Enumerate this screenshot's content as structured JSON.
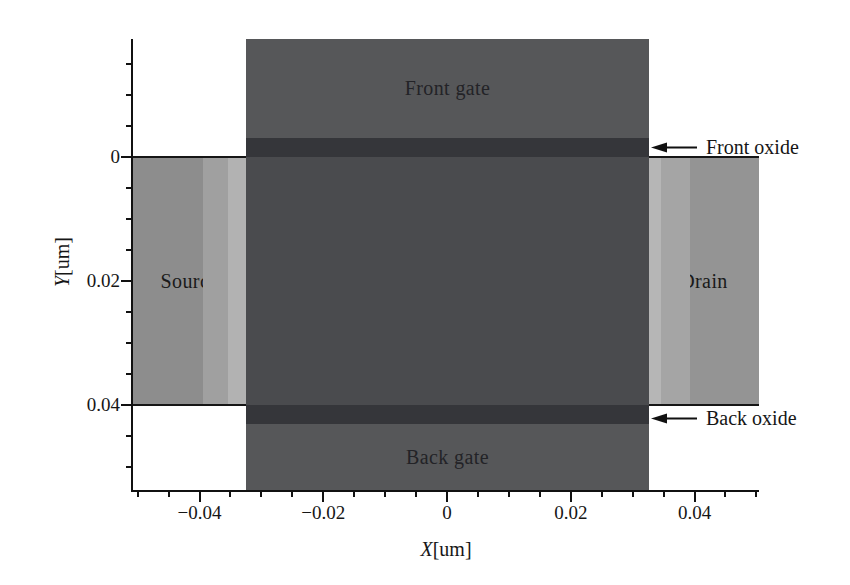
{
  "chart_data": {
    "type": "area",
    "title": "",
    "xlabel": "X[um]",
    "ylabel": "Y[um]",
    "x_axis": {
      "title_var": "X",
      "title_unit": "[um]",
      "range_um": [
        -0.0505,
        0.0505
      ],
      "major_ticks": [
        {
          "value": -0.04,
          "label": "−0.04"
        },
        {
          "value": -0.02,
          "label": "−0.02"
        },
        {
          "value": 0,
          "label": "0"
        },
        {
          "value": 0.02,
          "label": "0.02"
        },
        {
          "value": 0.04,
          "label": "0.04"
        }
      ],
      "minor_step_um": 0.005,
      "minor_range_um": [
        -0.05,
        0.05
      ]
    },
    "y_axis": {
      "title_var": "Y",
      "title_unit": "[um]",
      "range_um": [
        -0.019,
        0.054
      ],
      "direction": "increases-downward",
      "major_ticks": [
        {
          "value": 0,
          "label": "0"
        },
        {
          "value": 0.02,
          "label": "0.02"
        },
        {
          "value": 0.04,
          "label": "0.04"
        }
      ],
      "minor_step_um": 0.005,
      "minor_range_um": [
        -0.015,
        0.05
      ]
    },
    "regions": {
      "front_gate": {
        "label": "Front gate",
        "color": "#565759",
        "x_um": [
          -0.0325,
          0.0325
        ],
        "y_um": [
          -0.019,
          -0.0031
        ]
      },
      "front_oxide": {
        "label": "",
        "color": "#35363a",
        "x_um": [
          -0.0325,
          0.0325
        ],
        "y_um": [
          -0.0031,
          0
        ]
      },
      "channel_body": {
        "label": "",
        "color": "#4a4b4e",
        "x_um": [
          -0.0325,
          0.0325
        ],
        "y_um": [
          0,
          0.04
        ]
      },
      "back_oxide": {
        "label": "",
        "color": "#35363a",
        "x_um": [
          -0.0325,
          0.0325
        ],
        "y_um": [
          0.04,
          0.0431
        ]
      },
      "back_gate": {
        "label": "Back gate",
        "color": "#565759",
        "x_um": [
          -0.0325,
          0.0325
        ],
        "y_um": [
          0.0431,
          0.054
        ]
      },
      "source": {
        "label": "Source",
        "color": "#8d8d8d",
        "stripe_colors": [
          "#a0a0a0",
          "#b2b2b2"
        ],
        "x_um": [
          -0.0505,
          -0.0325
        ],
        "y_um": [
          0,
          0.04
        ]
      },
      "drain": {
        "label": "Drain",
        "color": "#949494",
        "stripe_colors": [
          "#b6b6b6",
          "#a5a5a5"
        ],
        "x_um": [
          0.0325,
          0.0505
        ],
        "y_um": [
          0,
          0.04
        ]
      }
    },
    "annotations": [
      {
        "label": "Front oxide",
        "points_to": "front_oxide"
      },
      {
        "label": "Back oxide",
        "points_to": "back_oxide"
      }
    ]
  },
  "colors": {
    "background": "#ffffff",
    "axis": "#111111",
    "text": "#1d1d1d",
    "gate": "#565759",
    "oxide": "#35363a",
    "body": "#4a4b4e",
    "source_base": "#8d8d8d",
    "drain_base": "#949494",
    "stripe_mid": "#a2a2a2",
    "stripe_light": "#b4b4b4"
  }
}
